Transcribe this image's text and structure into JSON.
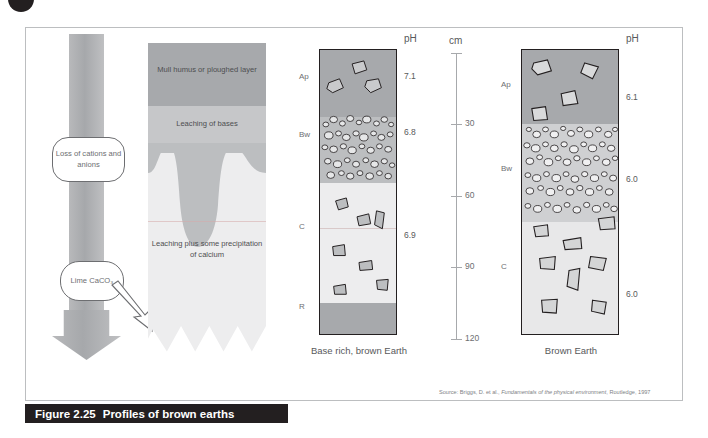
{
  "figure": {
    "number": "Figure 2.25",
    "caption": "Profiles of brown earths",
    "source": "Source: Briggs, D. et al., Fundamentals of the physical environment, Routledge, 1997",
    "source_prefix": "Source: Briggs, D. et al., ",
    "source_italic": "Fundamentals of the physical environment",
    "source_suffix": ", Routledge, 1997"
  },
  "process_panel": {
    "callouts": [
      {
        "id": "loss",
        "text": "Loss of cations and anions"
      },
      {
        "id": "lime",
        "text": "Lime CaCO₃"
      }
    ],
    "arrow_direction": "down"
  },
  "leaching_panel": {
    "labels": [
      {
        "id": "mull",
        "text": "Mull humus or ploughed layer"
      },
      {
        "id": "leaching_bases",
        "text": "Leaching of bases"
      },
      {
        "id": "leaching_plus",
        "text": "Leaching plus some precipitation of calcium"
      }
    ]
  },
  "scale": {
    "unit_label": "cm",
    "ticks": [
      0,
      30,
      60,
      90,
      120
    ],
    "tick_labels": [
      "",
      "30",
      "60",
      "90",
      "120"
    ],
    "min": 0,
    "max": 120
  },
  "profiles": [
    {
      "id": "base-rich-brown-earth",
      "title": "Base rich, brown Earth",
      "ph_header": "pH",
      "horizons": [
        {
          "code": "Ap",
          "top_cm": 0,
          "bottom_cm": 28,
          "ph": "7.1",
          "fill": "#a7a9ac",
          "stones": "few-large"
        },
        {
          "code": "Bw",
          "top_cm": 28,
          "bottom_cm": 56,
          "ph": "6.8",
          "fill": "#bcbec0",
          "stones": "many-small"
        },
        {
          "code": "C",
          "top_cm": 56,
          "bottom_cm": 106,
          "ph": "6.9",
          "fill": "#ededee",
          "stones": "scattered"
        },
        {
          "code": "R",
          "top_cm": 106,
          "bottom_cm": 120,
          "ph": "",
          "fill": "#a7a9ac",
          "stones": "none"
        }
      ]
    },
    {
      "id": "brown-earth",
      "title": "Brown Earth",
      "ph_header": "pH",
      "horizons": [
        {
          "code": "Ap",
          "top_cm": 0,
          "bottom_cm": 31,
          "ph": "6.1",
          "fill": "#a7a9ac",
          "stones": "few-large"
        },
        {
          "code": "Bw",
          "top_cm": 31,
          "bottom_cm": 72,
          "ph": "6.0",
          "fill": "#cfd0d2",
          "stones": "many-small"
        },
        {
          "code": "C",
          "top_cm": 72,
          "bottom_cm": 120,
          "ph": "6.0",
          "fill": "#e8e8e9",
          "stones": "scattered"
        }
      ]
    }
  ],
  "colors": {
    "dark_grey": "#a7a9ac",
    "mid_grey": "#bcbec0",
    "light_grey": "#ededee",
    "outline": "#231f20",
    "frame": "#bcbec0",
    "text": "#58595b"
  }
}
